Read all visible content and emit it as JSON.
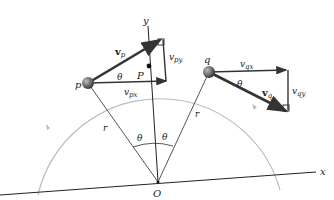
{
  "diagram": {
    "colors": {
      "axis": "#222222",
      "path": "#b8b8b8",
      "vector": "#333333",
      "particle": "#5a5a5a",
      "radius": "#555555"
    },
    "axes": {
      "x_label": "x",
      "y_label": "y",
      "origin_label": "O"
    },
    "points": {
      "p_label": "p",
      "q_label": "q",
      "P_label": "P"
    },
    "radius_label": "r",
    "angle_label": "θ",
    "vectors": {
      "vp": {
        "base": "v",
        "sub": "p"
      },
      "vpx": {
        "base": "v",
        "sub": "px"
      },
      "vpy": {
        "base": "v",
        "sub": "py"
      },
      "vq": {
        "base": "v",
        "sub": "q"
      },
      "vqx": {
        "base": "v",
        "sub": "qx"
      },
      "vqy": {
        "base": "v",
        "sub": "qy"
      }
    }
  }
}
